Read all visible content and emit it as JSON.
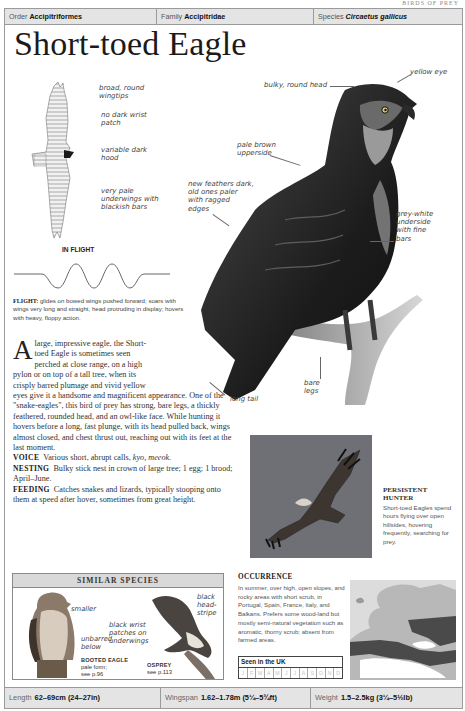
{
  "running_head": "BIRDS OF PREY",
  "taxonomy": {
    "order_label": "Order",
    "order_value": "Accipitriformes",
    "family_label": "Family",
    "family_value": "Accipitridae",
    "species_label": "Species",
    "species_value": "Circaetus gallicus"
  },
  "title": "Short-toed Eagle",
  "flight_illustration": {
    "labels": [
      {
        "line1": "broad, round",
        "line2": "wingtips"
      },
      {
        "line1": "no dark wrist",
        "line2": "patch"
      },
      {
        "line1": "variable dark",
        "line2": "hood"
      },
      {
        "line1": "very pale",
        "line2": "underwings with",
        "line3": "blackish bars"
      }
    ],
    "heading": "IN FLIGHT",
    "flight_label": "FLIGHT:",
    "flight_text": "glides on bowed wings pushed forward; soars with wings very long and straight, head protruding in display; hovers with heavy, floppy action."
  },
  "main_illustration": {
    "labels": {
      "bulky_head": "bulky, round head",
      "yellow_eye": "yellow eye",
      "upperside_1": "pale brown",
      "upperside_2": "upperside",
      "feathers_1": "new feathers dark,",
      "feathers_2": "old ones paler",
      "feathers_3": "with ragged",
      "feathers_4": "edges",
      "underside_1": "grey-white",
      "underside_2": "underside",
      "underside_3": "with fine",
      "underside_4": "bars",
      "legs_1": "bare",
      "legs_2": "legs",
      "tail": "long tail"
    }
  },
  "description": {
    "dropcap": "A",
    "line1": "large, impressive eagle, the Short-",
    "line2": "toed Eagle is sometimes seen",
    "line3": "perched at close range, on a high",
    "line4": "pylon or on top of a tall tree, when its",
    "line5": "crisply barred plumage and vivid yellow",
    "rest": "eyes give it a handsome and magnificent appearance. One of the \"snake-eagles\", this bird of prey has strong, bare legs, a thickly feathered, rounded head, and an owl-like face. While hunting it hovers before a long, fast plunge, with its head pulled back, wings almost closed, and chest thrust out, reaching out with its feet at the last moment.",
    "voice_label": "VOICE",
    "voice_text": "Various short, abrupt calls,",
    "voice_calls": "kyo, meeok.",
    "nesting_label": "NESTING",
    "nesting_text": "Bulky stick nest in crown of large tree; 1 egg; 1 brood; April–June.",
    "feeding_label": "FEEDING",
    "feeding_text": "Catches snakes and lizards, typically stooping onto them at speed after hover, sometimes from great height."
  },
  "photo_caption": {
    "title": "PERSISTENT HUNTER",
    "text": "Short-toed Eagles spend hours flying over open hillsides, hovering frequently, searching for prey."
  },
  "similar_species": {
    "heading": "SIMILAR SPECIES",
    "booted": {
      "label_smaller": "smaller",
      "label_unbarred_1": "unbarred",
      "label_unbarred_2": "below",
      "name": "BOOTED EAGLE",
      "sub1": "pale form;",
      "sub2": "see p.96"
    },
    "osprey": {
      "label_wrist_1": "black wrist",
      "label_wrist_2": "patches on",
      "label_wrist_3": "underwings",
      "label_stripe_1": "black",
      "label_stripe_2": "head-",
      "label_stripe_3": "stripe",
      "name": "OSPREY",
      "sub1": "see p.113"
    }
  },
  "occurrence": {
    "heading": "OCCURRENCE",
    "text": "In summer, over high, open slopes, and rocky areas with short scrub, in Portugal, Spain, France, Italy, and Balkans. Prefers some wood-land but mostly semi-natural vegetation such as aromatic, thorny scrub; absent from farmed areas.",
    "seen_title": "Seen in the UK",
    "months": [
      "J",
      "F",
      "M",
      "A",
      "M",
      "J",
      "J",
      "A",
      "S",
      "O",
      "N",
      "D"
    ]
  },
  "footer": {
    "length_label": "Length",
    "length_value": "62–69cm (24–27in)",
    "wingspan_label": "Wingspan",
    "wingspan_value": "1.62–1.78m (5¼–5¾ft)",
    "weight_label": "Weight",
    "weight_value": "1.5–2.5kg (3¼–5½lb)"
  },
  "colors": {
    "bar_bg": "#e4e4e4",
    "border": "#9a9a9a",
    "photo_sky": "#6f7075",
    "map_range": "#4a4a4a"
  }
}
